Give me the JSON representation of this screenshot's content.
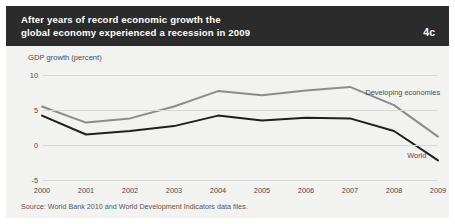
{
  "figure": {
    "number_label": "4c",
    "title_lines": [
      "After years of record economic growth the",
      "global economy experienced a recession in 2009"
    ],
    "source": "Source: World Bank 2010 and World Development Indicators data files."
  },
  "colors": {
    "title_band": "#2b2b2b",
    "panel_background": "#f2f2f0",
    "gridline": "#d8d8d4",
    "developing_economies_line": "#8c8c8c",
    "world_line": "#1f1f1f",
    "text": "#4a4a4a"
  },
  "chart_data": {
    "type": "line",
    "title": "After years of record economic growth the global economy experienced a recession in 2009",
    "xlabel": "",
    "ylabel": "GDP growth (percent)",
    "categories": [
      "2000",
      "2001",
      "2002",
      "2003",
      "2004",
      "2005",
      "2006",
      "2007",
      "2008",
      "2009"
    ],
    "x": [
      2000,
      2001,
      2002,
      2003,
      2004,
      2005,
      2006,
      2007,
      2008,
      2009
    ],
    "ylim": [
      -5,
      10
    ],
    "yticks": [
      "10",
      "5",
      "0",
      "-5"
    ],
    "ytick_values": [
      10,
      5,
      0,
      -5
    ],
    "grid": true,
    "legend_position": "inline-labels",
    "series": [
      {
        "name": "Developing economies",
        "color": "#8c8c8c",
        "values": [
          5.5,
          3.2,
          3.8,
          5.5,
          7.7,
          7.1,
          7.8,
          8.3,
          5.7,
          1.2
        ],
        "label_x": 2007.35,
        "label_y": 7.4
      },
      {
        "name": "World",
        "color": "#1f1f1f",
        "values": [
          4.2,
          1.5,
          2.0,
          2.7,
          4.2,
          3.5,
          3.9,
          3.8,
          2.0,
          -2.2
        ],
        "label_x": 2008.3,
        "label_y": -1.6
      }
    ]
  }
}
